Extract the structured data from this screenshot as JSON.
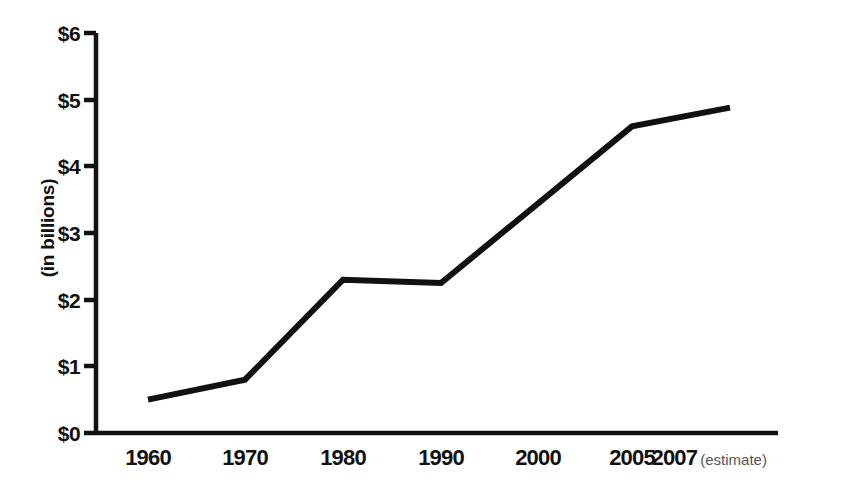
{
  "chart_data": {
    "type": "line",
    "title": "",
    "subtitle": "",
    "xlabel": "",
    "ylabel": "(in billions)",
    "categories": [
      "1960",
      "1970",
      "1980",
      "1990",
      "2000",
      "2005",
      "2007"
    ],
    "values": [
      0.5,
      0.8,
      2.3,
      2.25,
      3.7,
      4.6,
      4.88
    ],
    "series": [
      {
        "name": "",
        "values": [
          0.5,
          0.8,
          2.3,
          2.25,
          3.7,
          4.6,
          4.88
        ]
      }
    ],
    "points": [
      {
        "x": "1960",
        "y": 0.5,
        "vertex": true
      },
      {
        "x": "1970",
        "y": 0.8,
        "vertex": true
      },
      {
        "x": "1980",
        "y": 2.3,
        "vertex": true
      },
      {
        "x": "1990",
        "y": 2.25,
        "vertex": true
      },
      {
        "x": "2000",
        "y": 3.7,
        "vertex": false
      },
      {
        "x": "2005",
        "y": 4.6,
        "vertex": true
      },
      {
        "x": "2007",
        "y": 4.88,
        "vertex": true
      }
    ],
    "ylim": [
      0,
      6
    ],
    "yticks": [
      "$0",
      "$1",
      "$2",
      "$3",
      "$4",
      "$5",
      "$6"
    ],
    "ytick_values": [
      0,
      1,
      2,
      3,
      4,
      5,
      6
    ],
    "xticks": [
      "1960",
      "1970",
      "1980",
      "1990",
      "2000",
      "2005",
      "2007"
    ],
    "xtick_notes": [
      "",
      "",
      "",
      "",
      "",
      "",
      "(estimate)"
    ],
    "grid": false,
    "legend": false,
    "legend_position": "none",
    "line_color": "#111111",
    "axis_color": "#111111",
    "background_color": "#ffffff"
  },
  "axes": {
    "y_label": "(in billions)",
    "y_ticks": [
      {
        "label": "$6",
        "value": 6
      },
      {
        "label": "$5",
        "value": 5
      },
      {
        "label": "$4",
        "value": 4
      },
      {
        "label": "$3",
        "value": 3
      },
      {
        "label": "$2",
        "value": 2
      },
      {
        "label": "$1",
        "value": 1
      },
      {
        "label": "$0",
        "value": 0
      }
    ],
    "x_ticks": [
      {
        "label": "1960",
        "note": ""
      },
      {
        "label": "1970",
        "note": ""
      },
      {
        "label": "1980",
        "note": ""
      },
      {
        "label": "1990",
        "note": ""
      },
      {
        "label": "2000",
        "note": ""
      },
      {
        "label": "2005",
        "note": ""
      },
      {
        "label": "2007",
        "note": "(estimate)"
      }
    ]
  }
}
